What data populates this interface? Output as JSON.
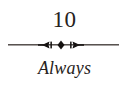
{
  "page": {
    "background_color": "#ffffff",
    "ink_color": "#262220",
    "rule_color": "#3b3532"
  },
  "heading": {
    "number": "10",
    "title": "Always"
  },
  "divider": {
    "icon_name": "ornamental-rule-icon",
    "description": "horizontal hairline rule with centered triple diamond/arrow ornament",
    "color": "#2a2522"
  }
}
